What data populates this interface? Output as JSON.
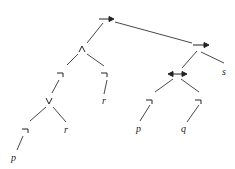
{
  "tree": {
    "root": {
      "label": "→",
      "type": "implies"
    },
    "nodes": [
      {
        "id": "n_root",
        "label": "→",
        "x": 106,
        "y": 19
      },
      {
        "id": "n_and",
        "label": "∧",
        "x": 82,
        "y": 49
      },
      {
        "id": "n_impl2",
        "label": "→",
        "x": 201,
        "y": 47
      },
      {
        "id": "n_not1",
        "label": "¬",
        "x": 61,
        "y": 75
      },
      {
        "id": "n_not2",
        "label": "¬",
        "x": 105,
        "y": 75
      },
      {
        "id": "n_iff",
        "label": "↔",
        "x": 177,
        "y": 74
      },
      {
        "id": "n_s",
        "label": "s",
        "x": 225,
        "y": 73
      },
      {
        "id": "n_or",
        "label": "∨",
        "x": 49,
        "y": 102
      },
      {
        "id": "n_r1",
        "label": "r",
        "x": 105,
        "y": 103
      },
      {
        "id": "n_not3",
        "label": "¬",
        "x": 150,
        "y": 102
      },
      {
        "id": "n_not4",
        "label": "¬",
        "x": 199,
        "y": 102
      },
      {
        "id": "n_not5",
        "label": "¬",
        "x": 26,
        "y": 131
      },
      {
        "id": "n_r2",
        "label": "r",
        "x": 67,
        "y": 131
      },
      {
        "id": "n_p1",
        "label": "p",
        "x": 138,
        "y": 131
      },
      {
        "id": "n_q",
        "label": "q",
        "x": 183,
        "y": 131
      },
      {
        "id": "n_p2",
        "label": "p",
        "x": 13,
        "y": 160
      }
    ]
  }
}
